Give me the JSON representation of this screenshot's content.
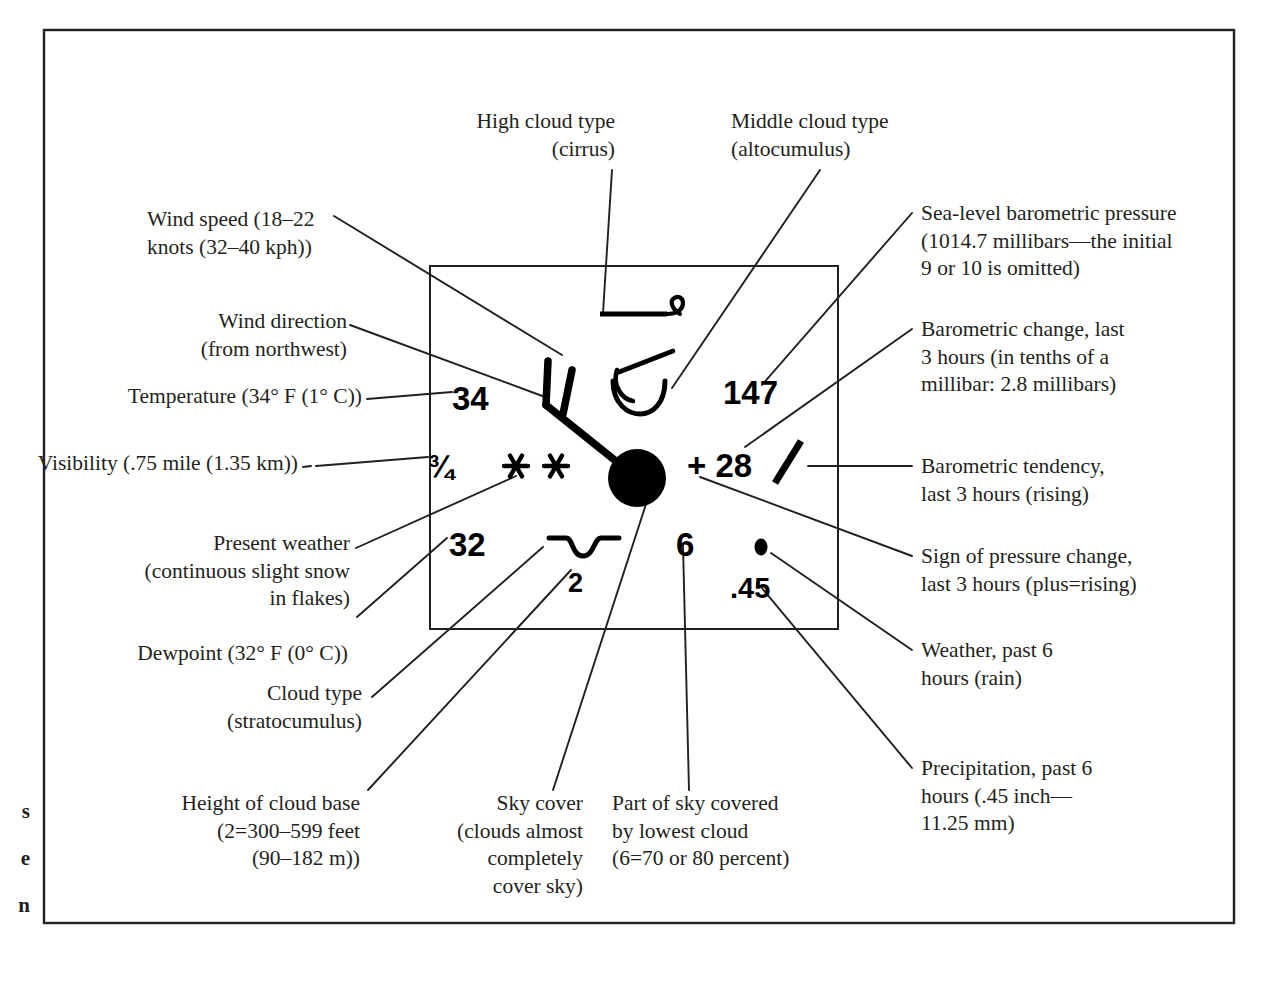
{
  "figure": {
    "kind": "weather-station-model-diagram",
    "title_visible": false,
    "frame_color": "#231f20",
    "ink_color": "#000000"
  },
  "margin_text": "s\ne\nn",
  "station_model": {
    "temperature": "34",
    "visibility": "¾",
    "dewpoint": "32",
    "cloud_base_height": "2",
    "pressure": "147",
    "pressure_change": "+ 28",
    "low_cloud_amount": "6",
    "precipitation": ".45",
    "present_weather_symbol": "snow-double-asterisk",
    "past_weather_symbol": "rain-dot",
    "sky_cover_symbol": "overcast-filled-circle",
    "wind_symbol": "wind-barb-northwest-two-full",
    "high_cloud_symbol": "cirrus-hook",
    "middle_cloud_symbol": "altocumulus-arc",
    "low_cloud_symbol": "stratocumulus-wave",
    "tendency_symbol": "rising-slash"
  },
  "callouts": {
    "high_cloud": "High cloud type\n(cirrus)",
    "middle_cloud": "Middle cloud type\n(altocumulus)",
    "wind_speed": "Wind speed (18–22\nknots (32–40 kph))",
    "wind_direction": "Wind direction\n(from northwest)",
    "temperature": "Temperature (34° F (1° C))",
    "visibility": "Visibility (.75 mile (1.35 km))",
    "present_weather": "Present weather\n(continuous slight snow\nin flakes)",
    "dewpoint": "Dewpoint (32° F (0° C))",
    "cloud_type": "Cloud type\n(stratocumulus)",
    "cloud_base": "Height of cloud base\n(2=300–599 feet\n(90–182 m))",
    "sky_cover": "Sky cover\n(clouds almost\ncompletely\ncover sky)",
    "part_of_sky": "Part of sky covered\nby lowest cloud\n(6=70 or 80 percent)",
    "sea_level_pressure": "Sea-level barometric pressure\n(1014.7 millibars—the initial\n9 or 10 is omitted)",
    "barometric_change": "Barometric change, last\n3 hours (in tenths of a\nmillibar: 2.8 millibars)",
    "barometric_tendency": "Barometric tendency,\nlast 3 hours (rising)",
    "sign_of_change": "Sign of pressure change,\nlast 3 hours (plus=rising)",
    "past_weather": "Weather, past 6\nhours (rain)",
    "precipitation": "Precipitation, past 6\nhours (.45 inch—\n11.25 mm)"
  }
}
